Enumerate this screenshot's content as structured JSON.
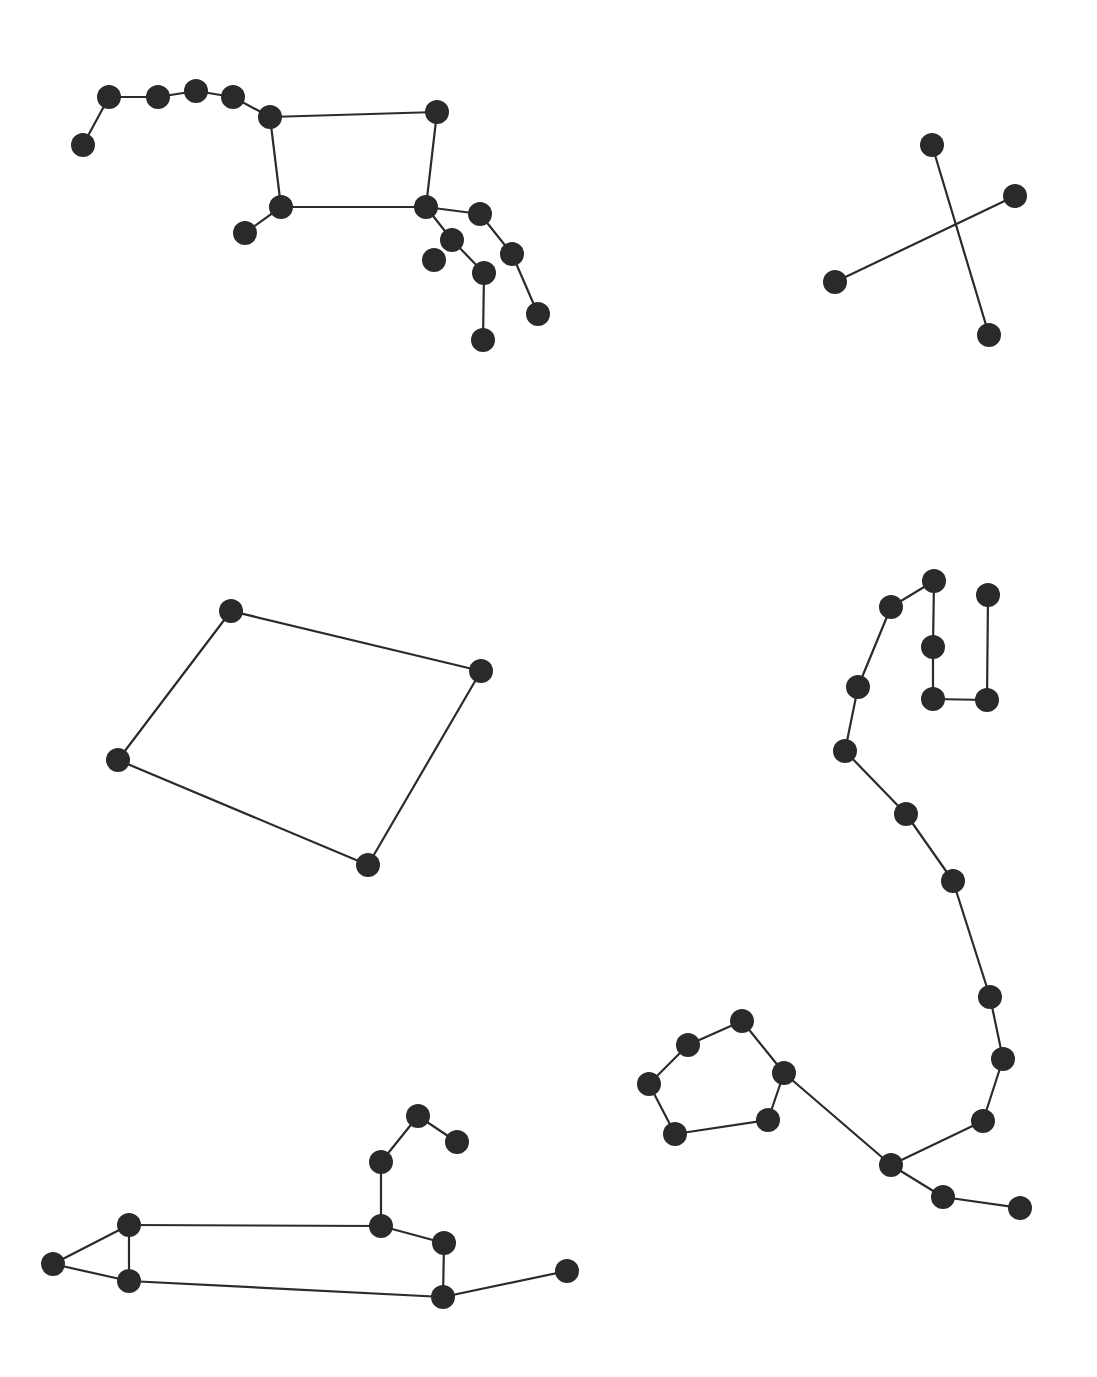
{
  "diagram": {
    "type": "constellation-diagrams",
    "width": 1097,
    "height": 1377,
    "colors": {
      "background": "#ffffff",
      "star": "#2a2a2a",
      "line": "#2b2b2b"
    },
    "star_radius": 12,
    "constellations": [
      {
        "id": "big-dipper-ursa-major",
        "stars": [
          [
            83,
            145
          ],
          [
            109,
            97
          ],
          [
            158,
            97
          ],
          [
            196,
            91
          ],
          [
            233,
            97
          ],
          [
            270,
            117
          ],
          [
            437,
            112
          ],
          [
            281,
            207
          ],
          [
            245,
            233
          ],
          [
            426,
            207
          ],
          [
            480,
            214
          ],
          [
            452,
            240
          ],
          [
            434,
            260
          ],
          [
            484,
            273
          ],
          [
            512,
            254
          ],
          [
            538,
            314
          ],
          [
            483,
            340
          ]
        ],
        "edges": [
          [
            0,
            1
          ],
          [
            1,
            2
          ],
          [
            2,
            3
          ],
          [
            3,
            4
          ],
          [
            4,
            5
          ],
          [
            5,
            6
          ],
          [
            5,
            7
          ],
          [
            6,
            9
          ],
          [
            7,
            9
          ],
          [
            7,
            8
          ],
          [
            9,
            10
          ],
          [
            10,
            14
          ],
          [
            14,
            15
          ],
          [
            9,
            11
          ],
          [
            11,
            13
          ],
          [
            13,
            16
          ]
        ]
      },
      {
        "id": "cross",
        "stars": [
          [
            932,
            145
          ],
          [
            1015,
            196
          ],
          [
            835,
            282
          ],
          [
            989,
            335
          ]
        ],
        "edges": [
          [
            0,
            3
          ],
          [
            1,
            2
          ]
        ]
      },
      {
        "id": "quadrilateral",
        "stars": [
          [
            231,
            611
          ],
          [
            481,
            671
          ],
          [
            368,
            865
          ],
          [
            118,
            760
          ]
        ],
        "edges": [
          [
            0,
            1
          ],
          [
            1,
            2
          ],
          [
            2,
            3
          ],
          [
            3,
            0
          ]
        ]
      },
      {
        "id": "scorpius",
        "stars": [
          [
            988,
            595
          ],
          [
            987,
            700
          ],
          [
            933,
            699
          ],
          [
            933,
            647
          ],
          [
            934,
            581
          ],
          [
            891,
            607
          ],
          [
            858,
            687
          ],
          [
            845,
            751
          ],
          [
            906,
            814
          ],
          [
            953,
            881
          ],
          [
            990,
            997
          ],
          [
            1003,
            1059
          ],
          [
            983,
            1121
          ],
          [
            891,
            1165
          ],
          [
            943,
            1197
          ],
          [
            1020,
            1208
          ],
          [
            784,
            1073
          ],
          [
            742,
            1021
          ],
          [
            688,
            1045
          ],
          [
            649,
            1084
          ],
          [
            675,
            1134
          ],
          [
            768,
            1120
          ]
        ],
        "edges": [
          [
            0,
            1
          ],
          [
            1,
            2
          ],
          [
            2,
            3
          ],
          [
            3,
            4
          ],
          [
            4,
            5
          ],
          [
            5,
            6
          ],
          [
            6,
            7
          ],
          [
            7,
            8
          ],
          [
            8,
            9
          ],
          [
            9,
            10
          ],
          [
            10,
            11
          ],
          [
            11,
            12
          ],
          [
            12,
            13
          ],
          [
            13,
            14
          ],
          [
            14,
            15
          ],
          [
            13,
            16
          ],
          [
            16,
            17
          ],
          [
            17,
            18
          ],
          [
            18,
            19
          ],
          [
            19,
            20
          ],
          [
            20,
            21
          ],
          [
            21,
            16
          ]
        ]
      },
      {
        "id": "leo",
        "stars": [
          [
            53,
            1264
          ],
          [
            129,
            1225
          ],
          [
            129,
            1281
          ],
          [
            381,
            1226
          ],
          [
            444,
            1243
          ],
          [
            443,
            1297
          ],
          [
            567,
            1271
          ],
          [
            381,
            1162
          ],
          [
            418,
            1116
          ],
          [
            457,
            1142
          ]
        ],
        "edges": [
          [
            0,
            1
          ],
          [
            0,
            2
          ],
          [
            1,
            2
          ],
          [
            1,
            3
          ],
          [
            2,
            5
          ],
          [
            3,
            4
          ],
          [
            4,
            5
          ],
          [
            5,
            6
          ],
          [
            3,
            7
          ],
          [
            7,
            8
          ],
          [
            8,
            9
          ]
        ]
      }
    ]
  }
}
